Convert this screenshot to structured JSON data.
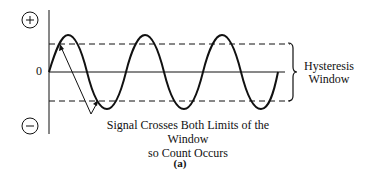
{
  "diagram": {
    "axis": {
      "plus_symbol": "+",
      "minus_symbol": "−",
      "zero_label": "0"
    },
    "window_label": "Hysteresis Window",
    "window_label_lines": [
      "Hysteresis",
      "Window"
    ],
    "annotation_lines": [
      "Signal Crosses Both Limits of the Window",
      "so Count Occurs"
    ],
    "figure_label": "(a)",
    "signal": {
      "type": "sine",
      "cycles": 3,
      "start_phase": "zero-crossing rising",
      "amplitude_exceeds_window": true
    },
    "colors": {
      "line": "#111111",
      "background": "#ffffff"
    }
  }
}
